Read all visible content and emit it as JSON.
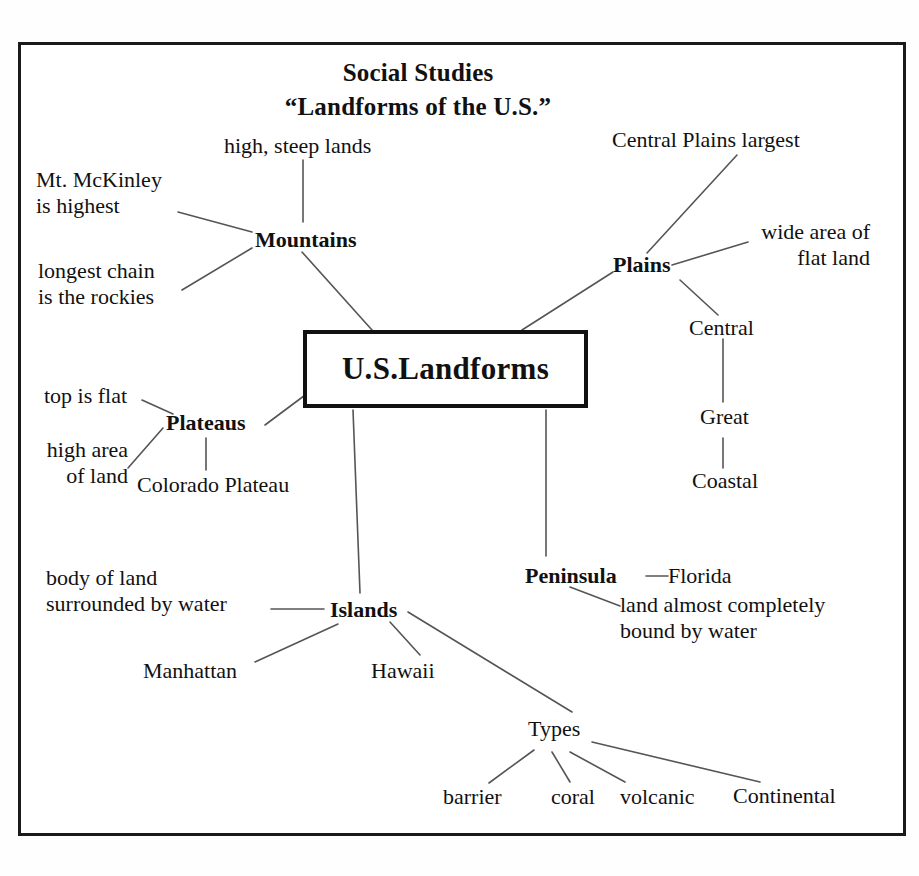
{
  "document": {
    "kind": "concept-map",
    "subject_line1": "Social Studies",
    "subject_line2": "“Landforms of the U.S.”",
    "border_color": "#1a1a1a",
    "text_color": "#111111",
    "line_color": "#555555"
  },
  "center": {
    "label": "U.S.Landforms"
  },
  "branches": {
    "mountains": {
      "label": "Mountains",
      "details": [
        "high, steep lands",
        "Mt. McKinley\nis highest",
        "longest chain\nis the rockies"
      ]
    },
    "plains": {
      "label": "Plains",
      "details": [
        "Central Plains largest",
        "wide area of\nflat land"
      ],
      "chain": [
        "Central",
        "Great",
        "Coastal"
      ]
    },
    "plateaus": {
      "label": "Plateaus",
      "details": [
        "top is flat",
        "high area\nof land",
        "Colorado Plateau"
      ]
    },
    "islands": {
      "label": "Islands",
      "details": [
        "body of land\nsurrounded by water",
        "Manhattan",
        "Hawaii"
      ],
      "types": {
        "label": "Types",
        "items": [
          "barrier",
          "coral",
          "volcanic",
          "Continental"
        ]
      }
    },
    "peninsula": {
      "label": "Peninsula",
      "details": [
        "Florida",
        "land almost completely\nbound by water"
      ]
    }
  }
}
